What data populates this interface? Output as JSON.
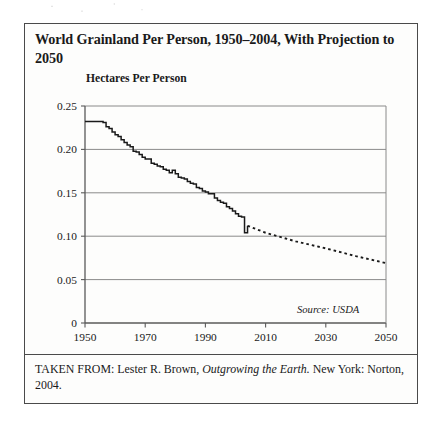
{
  "figure": {
    "title": "World Grainland Per Person, 1950–2004, With Projection to 2050",
    "axis_title": "Hectares Per Person",
    "source_note": "Source: USDA",
    "caption_prefix": "TAKEN FROM: Lester R. Brown, ",
    "caption_italic": "Outgrowing the Earth.",
    "caption_suffix": " New York: Norton, 2004."
  },
  "colors": {
    "frame": "#4a4a4a",
    "gridline": "#8a8a8a",
    "axis": "#5a5a5a",
    "series_line": "#1a1a1a",
    "projection_line": "#1a1a1a",
    "paper": "#fdfdfc"
  },
  "chart_data": {
    "type": "line",
    "title": "World Grainland Per Person, 1950–2004, With Projection to 2050",
    "xlabel": "",
    "ylabel": "Hectares Per Person",
    "xlim": [
      1950,
      2050
    ],
    "ylim": [
      0,
      0.25
    ],
    "yticks": [
      0,
      0.05,
      0.1,
      0.15,
      0.2,
      0.25
    ],
    "ytick_labels": [
      "0",
      "0.05",
      "0.10",
      "0.15",
      "0.20",
      "0.25"
    ],
    "xticks": [
      1950,
      1970,
      1990,
      2010,
      2030,
      2050
    ],
    "xtick_labels": [
      "1950",
      "1970",
      "1990",
      "2010",
      "2030",
      "2050"
    ],
    "grid": "horizontal",
    "legend": "none",
    "annotations": [
      "Source: USDA"
    ],
    "series": [
      {
        "name": "Grainland per person (historical)",
        "style": "solid",
        "x": [
          1950,
          1952,
          1954,
          1956,
          1957,
          1958,
          1959,
          1960,
          1961,
          1962,
          1963,
          1964,
          1965,
          1966,
          1967,
          1968,
          1969,
          1970,
          1971,
          1972,
          1973,
          1974,
          1975,
          1976,
          1977,
          1978,
          1979,
          1980,
          1981,
          1982,
          1983,
          1984,
          1985,
          1986,
          1987,
          1988,
          1989,
          1990,
          1991,
          1992,
          1993,
          1994,
          1995,
          1996,
          1997,
          1998,
          1999,
          2000,
          2001,
          2002,
          2003,
          2004
        ],
        "y": [
          0.232,
          0.232,
          0.232,
          0.231,
          0.226,
          0.224,
          0.22,
          0.217,
          0.215,
          0.211,
          0.208,
          0.205,
          0.203,
          0.198,
          0.197,
          0.194,
          0.191,
          0.189,
          0.189,
          0.184,
          0.183,
          0.181,
          0.18,
          0.177,
          0.176,
          0.173,
          0.176,
          0.172,
          0.168,
          0.167,
          0.166,
          0.163,
          0.161,
          0.16,
          0.156,
          0.155,
          0.152,
          0.151,
          0.149,
          0.149,
          0.144,
          0.141,
          0.139,
          0.138,
          0.134,
          0.132,
          0.129,
          0.126,
          0.123,
          0.122,
          0.104,
          0.112
        ]
      },
      {
        "name": "Projection",
        "style": "dotted",
        "x": [
          2004,
          2010,
          2020,
          2030,
          2040,
          2050
        ],
        "y": [
          0.112,
          0.104,
          0.094,
          0.086,
          0.077,
          0.069
        ]
      }
    ]
  }
}
